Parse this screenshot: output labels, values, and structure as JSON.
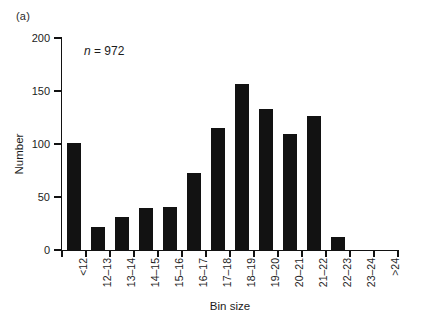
{
  "figure": {
    "panel_label": "(a)",
    "annotation": {
      "symbol": "n",
      "equals_value": "= 972",
      "full_text": "n = 972"
    }
  },
  "chart_data": {
    "type": "bar",
    "title": "",
    "subtitle": "",
    "xlabel": "Bin size",
    "ylabel": "Number",
    "categories": [
      "<12",
      "12–13",
      "13–14",
      "14–15",
      "15–16",
      "16–17",
      "17–18",
      "18–19",
      "19–20",
      "20–21",
      "21–22",
      "22–23",
      "23–24",
      ">24"
    ],
    "values": [
      101,
      22,
      31,
      40,
      41,
      73,
      115,
      157,
      133,
      109,
      126,
      12,
      0,
      0
    ],
    "ylim": [
      0,
      200
    ],
    "yticks": [
      0,
      50,
      100,
      150,
      200
    ],
    "ytick_labels": [
      "0",
      "50",
      "100",
      "150",
      "200"
    ],
    "grid": false,
    "legend": false,
    "legend_position": "none",
    "bar_color": "#121212",
    "axis_color": "#121212",
    "background_color": "#ffffff",
    "annotations": [
      {
        "text": "n = 972",
        "x_category": "12–13",
        "y_value": 185
      }
    ]
  }
}
